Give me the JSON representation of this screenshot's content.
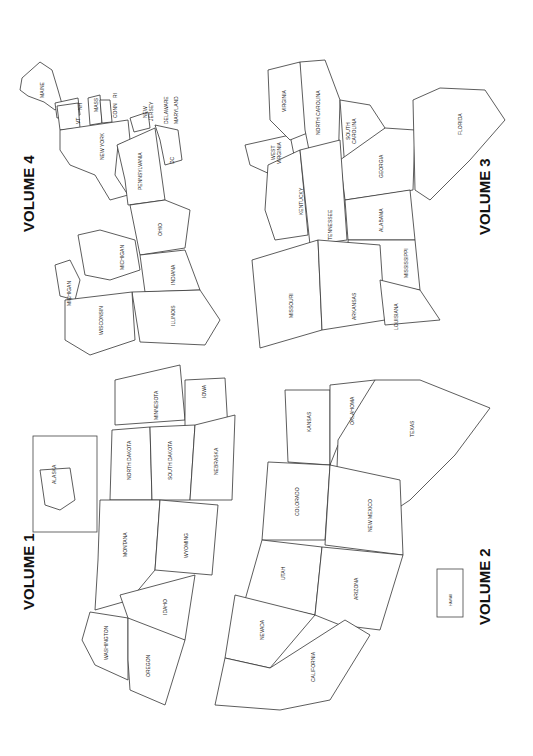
{
  "page": {
    "orientation": "rotated 90deg counter-clockwise",
    "background": "#ffffff",
    "line_color": "#333333"
  },
  "volumes": [
    {
      "label": "VOLUME 1",
      "states": [
        "WASHINGTON",
        "OREGON",
        "IDAHO",
        "MONTANA",
        "WYOMING",
        "NORTH DAKOTA",
        "SOUTH DAKOTA",
        "NEBRASKA",
        "MINNESOTA",
        "IOWA"
      ],
      "inset": "ALASKA"
    },
    {
      "label": "VOLUME 2",
      "states": [
        "CALIFORNIA",
        "NEVADA",
        "UTAH",
        "ARIZONA",
        "COLORADO",
        "NEW MEXICO",
        "KANSAS",
        "OKLAHOMA",
        "TEXAS"
      ],
      "inset": "HAWAII"
    },
    {
      "label": "VOLUME 3",
      "states": [
        "MISSOURI",
        "ARKANSAS",
        "LOUISIANA",
        "KENTUCKY",
        "TENNESSEE",
        "MISSISSIPPI",
        "ALABAMA",
        "WEST VIRGINIA",
        "VIRGINIA",
        "NORTH CAROLINA",
        "SOUTH CAROLINA",
        "GEORGIA",
        "FLORIDA"
      ]
    },
    {
      "label": "VOLUME 4",
      "states": [
        "WISCONSIN",
        "MICHIGAN",
        "MICHIGAN",
        "ILLINOIS",
        "INDIANA",
        "OHIO",
        "PENNSYLVANIA",
        "NEW YORK",
        "MAINE",
        "VT",
        "NH",
        "MASS",
        "CONN",
        "RI",
        "NEW JERSEY",
        "DELAWARE",
        "MARYLAND",
        "DC"
      ]
    }
  ],
  "labels": {
    "v1": "VOLUME 1",
    "v2": "VOLUME 2",
    "v3": "VOLUME 3",
    "v4": "VOLUME 4",
    "wa": "WASHINGTON",
    "or": "OREGON",
    "id": "IDAHO",
    "mt": "MONTANA",
    "wy": "WYOMING",
    "nd": "NORTH DAKOTA",
    "sd": "SOUTH DAKOTA",
    "ne": "NEBRASKA",
    "mn": "MINNESOTA",
    "ia": "IOWA",
    "ak": "ALASKA",
    "hi": "HAWAII",
    "ca": "CALIFORNIA",
    "nv": "NEVADA",
    "ut": "UTAH",
    "az": "ARIZONA",
    "co": "COLORADO",
    "nm": "NEW MEXICO",
    "ks": "KANSAS",
    "ok": "OKLAHOMA",
    "tx": "TEXAS",
    "mo": "MISSOURI",
    "ar": "ARKANSAS",
    "la": "LOUISIANA",
    "ky": "KENTUCKY",
    "tn": "TENNESSEE",
    "ms": "MISSISSIPPI",
    "al": "ALABAMA",
    "wv1": "WEST",
    "wv2": "VIRGINIA",
    "va": "VIRGINIA",
    "nc": "NORTH CAROLINA",
    "sc1": "SOUTH",
    "sc2": "CAROLINA",
    "ga": "GEORGIA",
    "fl": "FLORIDA",
    "wi": "WISCONSIN",
    "miu": "MICHIGAN",
    "mil": "MICHIGAN",
    "il": "ILLINOIS",
    "in": "INDIANA",
    "oh": "OHIO",
    "pa": "PENNSYLVANIA",
    "ny": "NEW YORK",
    "me": "MAINE",
    "vt": "VT",
    "nh": "NH",
    "ma": "MASS",
    "ct": "CONN",
    "ri": "RI",
    "nj1": "NEW",
    "nj2": "JERSEY",
    "de": "DELAWARE",
    "md": "MARYLAND",
    "dc": "DC"
  }
}
